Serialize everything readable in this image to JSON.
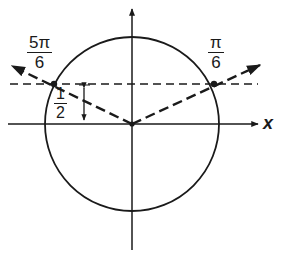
{
  "diagram": {
    "title": "",
    "colors": {
      "stroke": "#1a1a1a",
      "background": "#ffffff"
    },
    "axes": {
      "x_label": "x"
    },
    "angles": [
      {
        "numerator": "5π",
        "denominator": "6"
      },
      {
        "numerator": "π",
        "denominator": "6"
      }
    ],
    "height_label": {
      "numerator": "1",
      "denominator": "2"
    }
  }
}
